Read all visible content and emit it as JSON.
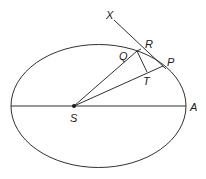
{
  "diagram": {
    "type": "geometry",
    "labels": {
      "X": "X",
      "R": "R",
      "Q": "Q",
      "P": "P",
      "T": "T",
      "S": "S",
      "A": "A"
    },
    "points": {
      "S": [
        74,
        106
      ],
      "A": [
        186,
        106
      ],
      "P": [
        163,
        66
      ],
      "Q": [
        137,
        51
      ],
      "R": [
        141,
        49
      ],
      "T": [
        147,
        72
      ],
      "X": [
        114,
        20
      ]
    },
    "ellipse": {
      "cx": 98.5,
      "cy": 106,
      "rx": 87.5,
      "ry": 61.5
    },
    "segments": [
      [
        "S",
        "A"
      ],
      [
        "S",
        "Q"
      ],
      [
        "S",
        "P"
      ],
      [
        "Q",
        "T"
      ],
      [
        "X",
        "P"
      ],
      [
        "Q",
        "R"
      ]
    ],
    "colors": {
      "stroke": "#1a1a1a",
      "background": "#ffffff"
    }
  }
}
